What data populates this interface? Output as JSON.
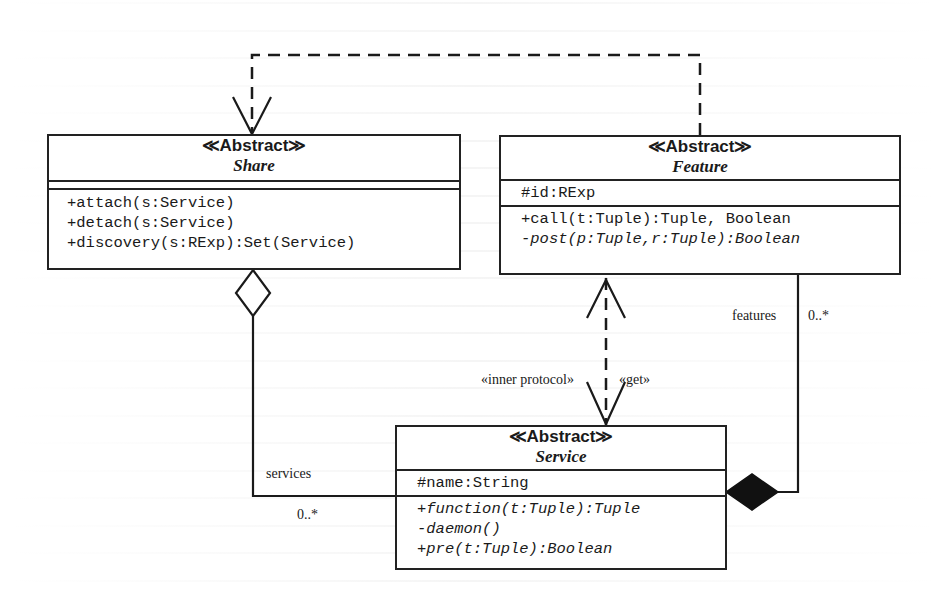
{
  "diagram": {
    "type": "uml-class-diagram",
    "classes": {
      "share": {
        "stereotype": "Abstract",
        "name": "Share",
        "attributes": [],
        "operations": [
          {
            "text": "+attach(s:Service)",
            "italic": false
          },
          {
            "text": "+detach(s:Service)",
            "italic": false
          },
          {
            "text": "+discovery(s:RExp):Set(Service)",
            "italic": false
          }
        ]
      },
      "feature": {
        "stereotype": "Abstract",
        "name": "Feature",
        "attributes": [
          {
            "text": "#id:RExp",
            "italic": false
          }
        ],
        "operations": [
          {
            "text": "+call(t:Tuple):Tuple, Boolean",
            "italic": false
          },
          {
            "text": "-post(p:Tuple,r:Tuple):Boolean",
            "italic": true
          }
        ]
      },
      "service": {
        "stereotype": "Abstract",
        "name": "Service",
        "attributes": [
          {
            "text": "#name:String",
            "italic": false
          }
        ],
        "operations": [
          {
            "text": "+function(t:Tuple):Tuple",
            "italic": true
          },
          {
            "text": "-daemon()",
            "italic": true
          },
          {
            "text": "+pre(t:Tuple):Boolean",
            "italic": true
          }
        ]
      }
    },
    "relationships": [
      {
        "id": "feature-to-share",
        "kind": "dependency",
        "from": "Feature",
        "to": "Share",
        "label": ""
      },
      {
        "id": "service-to-feature",
        "kind": "dependency",
        "from": "Service",
        "to": "Feature",
        "label": "«get»"
      },
      {
        "id": "feature-to-service",
        "kind": "dependency",
        "from": "Feature",
        "to": "Service",
        "label": "«inner protocol»"
      },
      {
        "id": "share-services",
        "kind": "aggregation",
        "whole": "Share",
        "part": "Service",
        "role": "services",
        "multiplicity": "0..*"
      },
      {
        "id": "service-features",
        "kind": "composition",
        "whole": "Service",
        "part": "Feature",
        "role": "features",
        "multiplicity": "0..*"
      }
    ],
    "labels": {
      "inner_protocol": "«inner protocol»",
      "get": "«get»",
      "features_role": "features",
      "features_mult": "0..*",
      "services_role": "services",
      "services_mult": "0..*"
    },
    "stereo_left": "≪",
    "stereo_right": "≫"
  }
}
